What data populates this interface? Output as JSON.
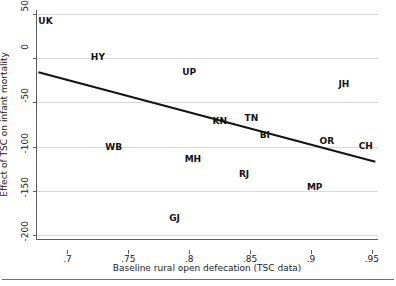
{
  "chart_data": {
    "type": "scatter",
    "title": "",
    "subtitle": "",
    "xlabel": "Baseline rural open defecation (TSC data)",
    "ylabel": "Effect of TSC on infant mortality",
    "xlim": [
      0.675,
      0.955
    ],
    "ylim": [
      -205,
      55
    ],
    "xticks": [
      0.7,
      0.75,
      0.8,
      0.85,
      0.9,
      0.95
    ],
    "xtick_labels": [
      ".7",
      ".75",
      ".8",
      ".85",
      ".9",
      ".95"
    ],
    "yticks": [
      50,
      0,
      -50,
      -100,
      -150,
      -200
    ],
    "ytick_labels": [
      "50",
      "0",
      "-50",
      "-100",
      "-150",
      "-200"
    ],
    "grid": "horizontal",
    "legend": "none",
    "marker_style": "text-label-only",
    "points": [
      {
        "label": "UK",
        "x": 0.682,
        "y": 43
      },
      {
        "label": "HY",
        "x": 0.725,
        "y": 2
      },
      {
        "label": "UP",
        "x": 0.8,
        "y": -15
      },
      {
        "label": "JH",
        "x": 0.927,
        "y": -29
      },
      {
        "label": "KN",
        "x": 0.825,
        "y": -71
      },
      {
        "label": "TN",
        "x": 0.851,
        "y": -68
      },
      {
        "label": "BI",
        "x": 0.862,
        "y": -87
      },
      {
        "label": "OR",
        "x": 0.913,
        "y": -94
      },
      {
        "label": "CH",
        "x": 0.945,
        "y": -99
      },
      {
        "label": "WB",
        "x": 0.738,
        "y": -100
      },
      {
        "label": "MH",
        "x": 0.803,
        "y": -114
      },
      {
        "label": "RJ",
        "x": 0.845,
        "y": -131
      },
      {
        "label": "MP",
        "x": 0.903,
        "y": -146
      },
      {
        "label": "GJ",
        "x": 0.788,
        "y": -181
      }
    ],
    "fit_line": {
      "type": "linear-fit",
      "x_start": 0.677,
      "y_start": -16,
      "x_end": 0.952,
      "y_end": -117,
      "color": "#141414",
      "width_px": 2
    },
    "annotations": []
  }
}
